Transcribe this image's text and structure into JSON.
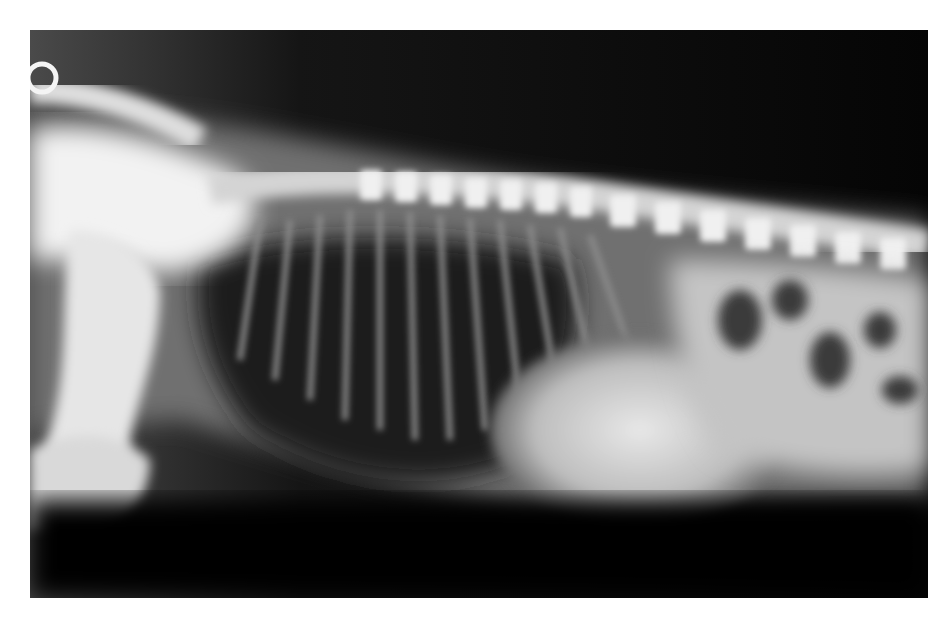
{
  "image": {
    "subject": "lateral thoracic radiograph",
    "background": "#ffffff",
    "film_color": "#050505",
    "bone_color": "#f4f4f4",
    "soft_tissue_color": "#9a9a9a",
    "frame": {
      "x": 30,
      "y": 30,
      "width": 898,
      "height": 568
    }
  }
}
